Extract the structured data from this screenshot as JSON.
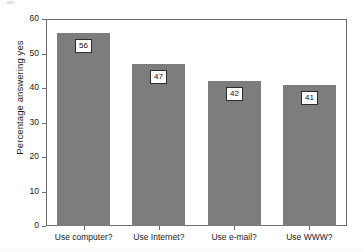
{
  "chart_data": {
    "type": "bar",
    "title": "",
    "subtitle": "",
    "xlabel": "",
    "ylabel": "Percentage answering yes",
    "categories": [
      "Use computer?",
      "Use Internet?",
      "Use e-mail?",
      "Use WWW?"
    ],
    "values": [
      56,
      47,
      42,
      41
    ],
    "value_labels": [
      "56",
      "47",
      "42",
      "41"
    ],
    "ylim": [
      0,
      60
    ],
    "yticks": [
      0,
      10,
      20,
      30,
      40,
      50,
      60
    ],
    "ytick_labels": [
      "0",
      "10",
      "20",
      "30",
      "40",
      "50",
      "60"
    ],
    "grid": false,
    "legend": false,
    "legend_position": "none",
    "bar_color": "#7d7d7d",
    "axis_color": "#6e6e6e",
    "label_box_border": "#2b2b2b",
    "label_box_fill": "#ffffff",
    "background": "#ffffff"
  }
}
